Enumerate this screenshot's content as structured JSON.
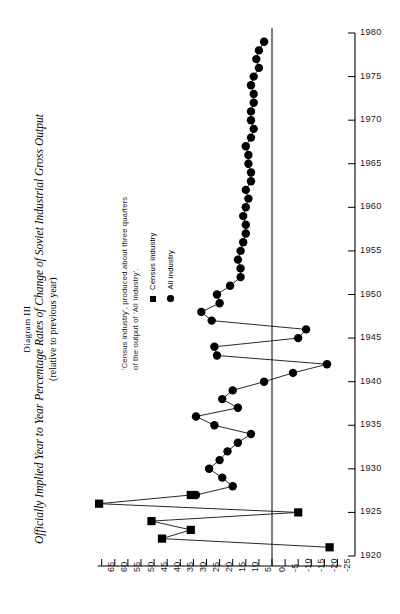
{
  "title": {
    "diagram_label": "Diagram III",
    "main": "Officially Implied Year to Year Percentage Rates of Change of Soviet Industrial Gross Output",
    "subtitle": "(relative to previous year)"
  },
  "note": {
    "line1": "'Census industry', produced about three quarters",
    "line2": "of the output of 'All Industry'."
  },
  "legend": {
    "items": [
      {
        "label": "Census industry",
        "marker": "square",
        "color": "#000000"
      },
      {
        "label": "All industry",
        "marker": "circle",
        "color": "#000000"
      }
    ]
  },
  "chart_data": {
    "type": "line",
    "title": "Officially Implied Year to Year Percentage Rates of Change of Soviet Industrial Gross Output",
    "subtitle": "(relative to previous year)",
    "orientation": "horizontal-value-vertical-year",
    "xlabel": "Percentage rate of change",
    "ylabel": "Year",
    "xlim": [
      -25,
      65
    ],
    "ylim": [
      1920,
      1980
    ],
    "grid": false,
    "legend_position": "left-middle",
    "x_ticks": [
      65,
      60,
      55,
      50,
      45,
      40,
      35,
      30,
      25,
      20,
      15,
      10,
      5,
      0,
      -5,
      -10,
      -15,
      -20,
      -25
    ],
    "x_tick_labels": [
      "65",
      "60",
      "55",
      "50",
      "45",
      "40",
      "35",
      "30",
      "25",
      "20",
      "15",
      "10",
      "5",
      "0",
      "-5",
      "-10",
      "-15",
      "-20",
      "-25"
    ],
    "y_ticks": [
      1920,
      1925,
      1930,
      1935,
      1940,
      1945,
      1950,
      1955,
      1960,
      1965,
      1970,
      1975,
      1980
    ],
    "y_tick_labels": [
      "1920",
      "1925",
      "1930",
      "1935",
      "1940",
      "1945",
      "1950",
      "1955",
      "1960",
      "1965",
      "1970",
      "1975",
      "1980"
    ],
    "series": [
      {
        "name": "Census industry",
        "marker": "square",
        "color": "#000000",
        "points": [
          {
            "year": 1921,
            "value": -22
          },
          {
            "year": 1922,
            "value": 42
          },
          {
            "year": 1923,
            "value": 31
          },
          {
            "year": 1924,
            "value": 46
          },
          {
            "year": 1925,
            "value": -10
          },
          {
            "year": 1926,
            "value": 66
          },
          {
            "year": 1927,
            "value": 31
          }
        ]
      },
      {
        "name": "All industry",
        "marker": "circle",
        "color": "#000000",
        "points": [
          {
            "year": 1927,
            "value": 29
          },
          {
            "year": 1928,
            "value": 15
          },
          {
            "year": 1929,
            "value": 19
          },
          {
            "year": 1930,
            "value": 24
          },
          {
            "year": 1931,
            "value": 20
          },
          {
            "year": 1932,
            "value": 17
          },
          {
            "year": 1933,
            "value": 13
          },
          {
            "year": 1934,
            "value": 8
          },
          {
            "year": 1935,
            "value": 22
          },
          {
            "year": 1936,
            "value": 29
          },
          {
            "year": 1937,
            "value": 13
          },
          {
            "year": 1938,
            "value": 19
          },
          {
            "year": 1939,
            "value": 15
          },
          {
            "year": 1940,
            "value": 3
          },
          {
            "year": 1941,
            "value": -8
          },
          {
            "year": 1942,
            "value": -21
          },
          {
            "year": 1943,
            "value": 21
          },
          {
            "year": 1944,
            "value": 22
          },
          {
            "year": 1945,
            "value": -10
          },
          {
            "year": 1946,
            "value": -13
          },
          {
            "year": 1947,
            "value": 23
          },
          {
            "year": 1948,
            "value": 27
          },
          {
            "year": 1949,
            "value": 20
          },
          {
            "year": 1950,
            "value": 21
          },
          {
            "year": 1951,
            "value": 16
          },
          {
            "year": 1952,
            "value": 12
          },
          {
            "year": 1953,
            "value": 12
          },
          {
            "year": 1954,
            "value": 13
          },
          {
            "year": 1955,
            "value": 12
          },
          {
            "year": 1956,
            "value": 11
          },
          {
            "year": 1957,
            "value": 10
          },
          {
            "year": 1958,
            "value": 10
          },
          {
            "year": 1959,
            "value": 11
          },
          {
            "year": 1960,
            "value": 10
          },
          {
            "year": 1961,
            "value": 9
          },
          {
            "year": 1962,
            "value": 10
          },
          {
            "year": 1963,
            "value": 8
          },
          {
            "year": 1964,
            "value": 8
          },
          {
            "year": 1965,
            "value": 9
          },
          {
            "year": 1966,
            "value": 9
          },
          {
            "year": 1967,
            "value": 10
          },
          {
            "year": 1968,
            "value": 8
          },
          {
            "year": 1969,
            "value": 7
          },
          {
            "year": 1970,
            "value": 8
          },
          {
            "year": 1971,
            "value": 8
          },
          {
            "year": 1972,
            "value": 7
          },
          {
            "year": 1973,
            "value": 7
          },
          {
            "year": 1974,
            "value": 8
          },
          {
            "year": 1975,
            "value": 7
          },
          {
            "year": 1976,
            "value": 5
          },
          {
            "year": 1977,
            "value": 6
          },
          {
            "year": 1978,
            "value": 5
          },
          {
            "year": 1979,
            "value": 3
          }
        ]
      }
    ]
  }
}
